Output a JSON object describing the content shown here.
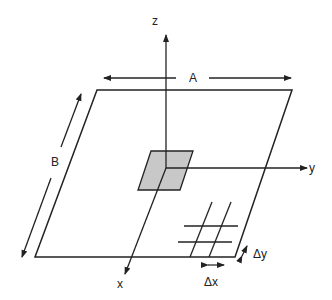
{
  "diagram": {
    "type": "plate-coordinate-schematic",
    "labels": {
      "z_axis": "z",
      "y_axis": "y",
      "x_axis": "x",
      "width_dim": "A",
      "length_dim": "B",
      "grid_dx": "Δx",
      "grid_dy": "Δy"
    },
    "colors": {
      "line": "#222222",
      "shaded_element": "#c8c8c8",
      "background": "#ffffff"
    }
  }
}
